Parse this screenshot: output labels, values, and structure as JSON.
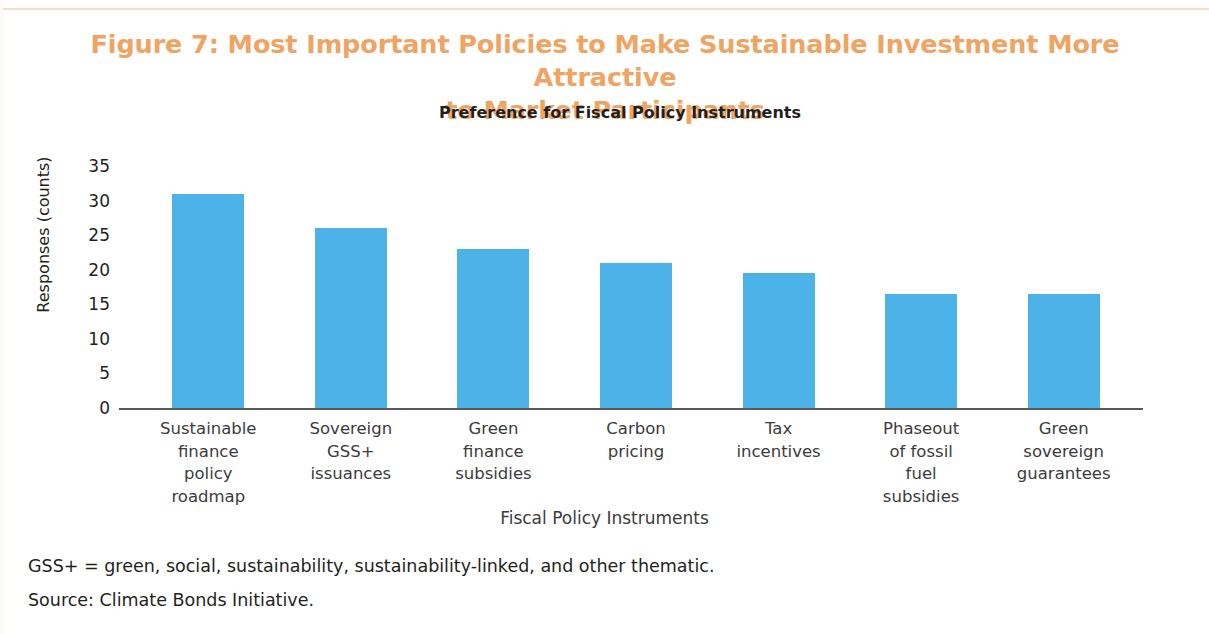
{
  "figure": {
    "title": "Figure 7: Most Important Policies to Make Sustainable Investment More Attractive to Market Participants",
    "title_line_1": "Figure 7: Most Important Policies to Make Sustainable Investment More Attractive",
    "title_line_2": "to Market Participants",
    "title_color": "#f0a464"
  },
  "notes": {
    "abbreviation": "GSS+ = green, social, sustainability, sustainability-linked, and other thematic.",
    "source": "Source: Climate Bonds Initiative."
  },
  "chart_data": {
    "type": "bar",
    "title": "Preference for Fiscal Policy Instruments",
    "xlabel": "Fiscal Policy Instruments",
    "ylabel": "Responses (counts)",
    "categories": [
      "Sustainable finance policy roadmap",
      "Sovereign GSS+ issuances",
      "Green finance subsidies",
      "Carbon pricing",
      "Tax incentives",
      "Phaseout of fossil fuel subsidies",
      "Green sovereign guarantees"
    ],
    "category_lines": [
      "Sustainable\nfinance\npolicy\nroadmap",
      "Sovereign\nGSS+\nissuances",
      "Green\nfinance\nsubsidies",
      "Carbon\npricing",
      "Tax\nincentives",
      "Phaseout\nof fossil\nfuel\nsubsidies",
      "Green\nsovereign\nguarantees"
    ],
    "values": [
      31,
      26,
      23,
      21,
      19.5,
      16.5,
      16.5
    ],
    "ylim": [
      0,
      35
    ],
    "yticks": [
      0,
      5,
      10,
      15,
      20,
      25,
      30,
      35
    ],
    "ytick_labels": [
      "0",
      "5",
      "10",
      "15",
      "20",
      "25",
      "30",
      "35"
    ],
    "bar_color": "#4cb2e8",
    "grid": false,
    "legend": "none"
  }
}
